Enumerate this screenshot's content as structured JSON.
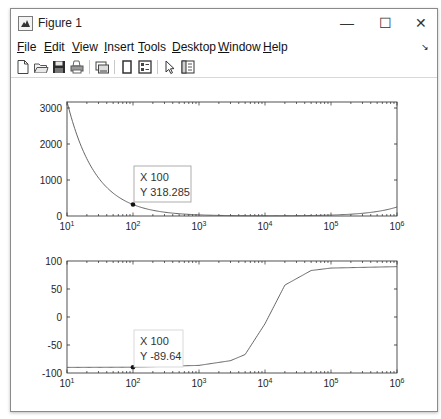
{
  "window": {
    "title": "Figure 1",
    "controls": {
      "minimize": "—",
      "maximize": "☐",
      "close": "✕"
    }
  },
  "menu": {
    "items": [
      {
        "label": "File",
        "mnemonic": "F"
      },
      {
        "label": "Edit",
        "mnemonic": "E"
      },
      {
        "label": "View",
        "mnemonic": "V"
      },
      {
        "label": "Insert",
        "mnemonic": "I"
      },
      {
        "label": "Tools",
        "mnemonic": "T"
      },
      {
        "label": "Desktop",
        "mnemonic": "D"
      },
      {
        "label": "Window",
        "mnemonic": "W"
      },
      {
        "label": "Help",
        "mnemonic": "H"
      }
    ],
    "dock_icon": "dock-arrow-icon"
  },
  "toolbar": {
    "buttons": [
      {
        "name": "new-figure-icon"
      },
      {
        "name": "open-file-icon"
      },
      {
        "name": "save-icon"
      },
      {
        "name": "print-icon"
      },
      {
        "name": "link-plot-icon"
      },
      {
        "name": "hide-plot-tools-icon"
      },
      {
        "name": "show-plot-tools-icon"
      },
      {
        "name": "edit-plot-pointer-icon"
      },
      {
        "name": "property-inspector-icon"
      }
    ]
  },
  "axes": [
    {
      "yticks": [
        "3000",
        "2000",
        "1000",
        "0"
      ],
      "xticks": [
        {
          "base": "10",
          "exp": "1"
        },
        {
          "base": "10",
          "exp": "2"
        },
        {
          "base": "10",
          "exp": "3"
        },
        {
          "base": "10",
          "exp": "4"
        },
        {
          "base": "10",
          "exp": "5"
        },
        {
          "base": "10",
          "exp": "6"
        }
      ],
      "datatip": {
        "x_label": "X 100",
        "y_label": "Y 318.285"
      }
    },
    {
      "yticks": [
        "100",
        "50",
        "0",
        "-50",
        "-100"
      ],
      "xticks": [
        {
          "base": "10",
          "exp": "1"
        },
        {
          "base": "10",
          "exp": "2"
        },
        {
          "base": "10",
          "exp": "3"
        },
        {
          "base": "10",
          "exp": "4"
        },
        {
          "base": "10",
          "exp": "5"
        },
        {
          "base": "10",
          "exp": "6"
        }
      ],
      "datatip": {
        "x_label": "X 100",
        "y_label": "Y -89.64"
      }
    }
  ],
  "chart_data": [
    {
      "type": "line",
      "title": "",
      "xlabel": "",
      "ylabel": "",
      "xscale": "log",
      "xlim": [
        10,
        1000000
      ],
      "ylim": [
        0,
        3150
      ],
      "grid": false,
      "series": [
        {
          "name": "magnitude",
          "x": [
            10,
            20,
            50,
            100,
            200,
            500,
            1000,
            3000,
            10000,
            30000,
            100000,
            300000,
            1000000
          ],
          "values": [
            3180,
            1590,
            636,
            318.285,
            159,
            63.6,
            31.9,
            11.3,
            5.7,
            8.6,
            25.3,
            75.1,
            250
          ]
        }
      ],
      "annotations": [
        {
          "type": "datatip",
          "x": 100,
          "y": 318.285,
          "text": "X 100\nY 318.285"
        }
      ]
    },
    {
      "type": "line",
      "title": "",
      "xlabel": "",
      "ylabel": "",
      "xscale": "log",
      "xlim": [
        10,
        1000000
      ],
      "ylim": [
        -100,
        100
      ],
      "grid": false,
      "series": [
        {
          "name": "phase",
          "x": [
            10,
            100,
            1000,
            3000,
            5000,
            10000,
            20000,
            50000,
            100000,
            1000000
          ],
          "values": [
            -90,
            -89.64,
            -86.4,
            -78,
            -67,
            -12,
            57,
            83,
            87.4,
            89.9
          ]
        }
      ],
      "annotations": [
        {
          "type": "datatip",
          "x": 100,
          "y": -89.64,
          "text": "X 100\nY -89.64"
        }
      ]
    }
  ]
}
